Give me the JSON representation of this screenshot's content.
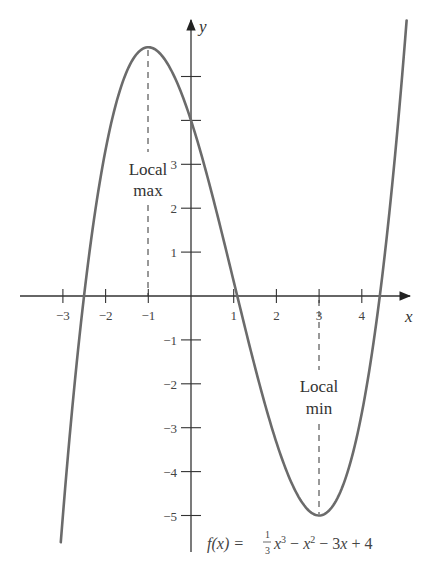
{
  "chart_data": {
    "type": "line",
    "title": "",
    "function_label": "f(x) = 1/3 x^3 - x^2 - 3x + 4",
    "formula": {
      "lhs": "f(x) =",
      "frac_num": "1",
      "frac_den": "3",
      "term1": "x",
      "exp1": "3",
      "minus1": " − ",
      "term2": "x",
      "exp2": "2",
      "rest": " − 3",
      "term3": "x",
      "tail": " + 4"
    },
    "xlabel": "x",
    "ylabel": "y",
    "xlim": [
      -3.05,
      5.05
    ],
    "ylim": [
      -5,
      5.7
    ],
    "x_ticks": [
      -3,
      -2,
      -1,
      1,
      2,
      3,
      4
    ],
    "x_tick_labels": [
      "−3",
      "−2",
      "−1",
      "1",
      "2",
      "3",
      "4"
    ],
    "y_ticks": [
      -5,
      -4,
      -3,
      -2,
      -1,
      1,
      2,
      3,
      4,
      5
    ],
    "y_tick_labels": [
      "−5",
      "−4",
      "−3",
      "−2",
      "−1",
      "1",
      "2",
      "3",
      "",
      ""
    ],
    "grid": false,
    "series": [
      {
        "name": "f(x)",
        "x": [
          -3,
          -2.5,
          -2,
          -1.5,
          -1,
          -0.5,
          0,
          0.5,
          1,
          1.5,
          2,
          2.5,
          3,
          3.5,
          4,
          4.5,
          5
        ],
        "values": [
          -5,
          -0.46,
          3.33,
          5.13,
          5.67,
          5.21,
          4,
          2.29,
          0.33,
          -1.63,
          -3.33,
          -4.54,
          -5,
          -4.46,
          -2.67,
          0.63,
          5.67
        ]
      }
    ],
    "annotations": [
      {
        "text_line1": "Local",
        "text_line2": "max",
        "x": -1,
        "y": 5.67
      },
      {
        "text_line1": "Local",
        "text_line2": "min",
        "x": 3,
        "y": -5
      }
    ],
    "colors": {
      "curve": "#6b6b6b",
      "axis": "#333333",
      "text": "#444444"
    }
  }
}
